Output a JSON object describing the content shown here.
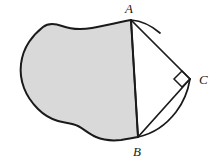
{
  "figure": {
    "type": "geometry-diagram",
    "canvas": {
      "width": 210,
      "height": 163
    },
    "colors": {
      "background": "#ffffff",
      "blob_fill": "#d9d9d9",
      "lune_fill": "#d4d4d4",
      "stroke": "#1a1a1a",
      "label": "#1a1a1a"
    },
    "vertices": [
      {
        "name": "A",
        "label": "A",
        "x": 131,
        "y": 20,
        "label_x": 129,
        "label_y": 12
      },
      {
        "name": "B",
        "label": "B",
        "x": 138,
        "y": 137,
        "label_x": 137,
        "label_y": 155
      },
      {
        "name": "C",
        "label": "C",
        "x": 190,
        "y": 79,
        "label_x": 200,
        "label_y": 81
      }
    ],
    "right_angle": {
      "at": "C",
      "marker": "square",
      "size": 9
    },
    "segments": [
      {
        "name": "chord-AB",
        "from": "A",
        "to": "B",
        "style": "straight"
      },
      {
        "name": "side-AC",
        "from": "A",
        "to": "C",
        "style": "straight"
      },
      {
        "name": "side-BC",
        "from": "B",
        "to": "C",
        "style": "straight"
      }
    ],
    "arcs": [
      {
        "name": "arc-AC",
        "from": "A",
        "to": "C",
        "bulge": "outward"
      },
      {
        "name": "arc-BC",
        "from": "B",
        "to": "C",
        "bulge": "outward"
      }
    ],
    "shaded_regions": [
      {
        "name": "blob-region",
        "fill": "#d9d9d9"
      },
      {
        "name": "lune-region",
        "fill": "#d4d4d4"
      }
    ],
    "blob_path": "M 131 20 L 131 20 C 120 22 104 26 92 28 C 80 30 70 29 62 26 C 54 23 48 23 43 27 C 38 31 33 36 29 42 C 25 48 22 56 21 64 C 20 72 21 80 24 88 C 27 96 32 103 38 109 C 44 115 51 119 58 121 C 65 123 72 123 78 126 C 84 129 89 134 96 137 C 103 140 112 141 121 140 C 127 139 133 138 138 137 L 138 137 Z",
    "lune_path": "M 138 137 L 190 79 C 180 92 168 104 158 114 C 150 122 143 130 138 137 Z",
    "arc_ac_path": "M 131 20 C 148 25 165 40 180 58 C 184 63 188 72 190 79"
  }
}
